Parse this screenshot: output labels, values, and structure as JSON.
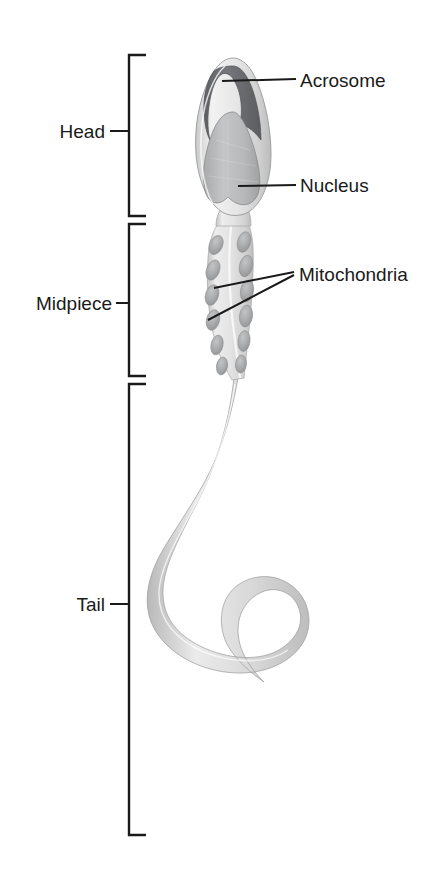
{
  "figure": {
    "background_color": "#ffffff",
    "line_color": "#1a1a1a"
  },
  "brackets": [
    {
      "id": "head",
      "label": "Head",
      "label_x": 108,
      "label_y": 131,
      "top": 54,
      "bottom": 216,
      "tick_x": 128,
      "tick_len": 18
    },
    {
      "id": "midpiece",
      "label": "Midpiece",
      "label_x": 113,
      "label_y": 310,
      "top": 224,
      "bottom": 376,
      "tick_x": 128,
      "tick_len": 18
    },
    {
      "id": "tail",
      "label": "Tail",
      "label_x": 108,
      "label_y": 611,
      "top": 384,
      "bottom": 835,
      "tick_x": 128,
      "tick_len": 18
    }
  ],
  "callouts": [
    {
      "id": "acrosome",
      "label": "Acrosome",
      "text_x": 300,
      "text_y": 88,
      "line": "M 222 83 L 296 80"
    },
    {
      "id": "nucleus",
      "label": "Nucleus",
      "text_x": 300,
      "text_y": 191,
      "line": "M 238 186 L 296 184"
    },
    {
      "id": "mitochondria",
      "label": "Mitochondria",
      "text_x": 300,
      "text_y": 281,
      "lines": [
        "M 216 287 L 293 272",
        "M 210 318 L 293 275"
      ]
    }
  ],
  "cell": {
    "head": {
      "membrane_fill": "#e9e9e9",
      "acrosome_fill": "#6f7073",
      "nucleus_fill": "#b9bbbd",
      "outline": "#8d8f91"
    },
    "midpiece": {
      "body_fill": "#dedede",
      "mitochondria_fill": "#a9abad",
      "mitochondria_count": 16
    },
    "tail": {
      "fill": "#d4d4d4",
      "outline": "#9a9a9a"
    }
  }
}
